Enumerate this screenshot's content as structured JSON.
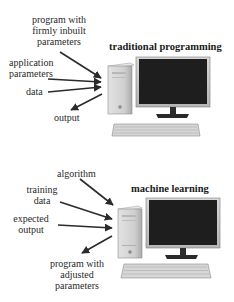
{
  "diagram": {
    "sections": [
      {
        "title": "traditional programming",
        "inputs": [
          {
            "label_lines": [
              "program with",
              "firmly inbuilt",
              "parameters"
            ]
          },
          {
            "label_lines": [
              "application",
              "parameters"
            ]
          },
          {
            "label_lines": [
              "data"
            ]
          }
        ],
        "outputs": [
          {
            "label_lines": [
              "output"
            ]
          }
        ],
        "device": "desktop-computer-icon"
      },
      {
        "title": "machine learning",
        "inputs": [
          {
            "label_lines": [
              "algorithm"
            ]
          },
          {
            "label_lines": [
              "training",
              "data"
            ]
          },
          {
            "label_lines": [
              "expected",
              "output"
            ]
          }
        ],
        "outputs": [
          {
            "label_lines": [
              "program with",
              "adjusted",
              "parameters"
            ]
          }
        ],
        "device": "desktop-computer-icon"
      }
    ],
    "colors": {
      "arrow": "#2b2b2b",
      "screen": "#1e1e1e",
      "tower": "#c9c9c9",
      "keyboard": "#d4d4d4"
    }
  }
}
